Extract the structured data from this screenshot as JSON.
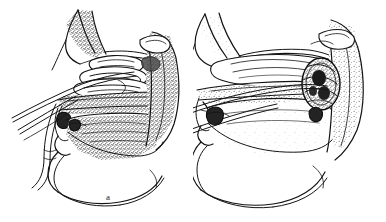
{
  "figure": {
    "kind": "anatomical-line-drawing",
    "background_color": "#ffffff",
    "ink_color": "#141414",
    "panel_count": 2,
    "width_px": 386,
    "height_px": 222
  },
  "panels": [
    {
      "id": "a",
      "caption": "a",
      "side": "left",
      "title": "Sagittal head section, panel a",
      "structures": [
        "nasal bridge",
        "frontal region",
        "superior turbinate",
        "middle turbinate",
        "inferior turbinate",
        "hard palate",
        "soft palate",
        "tongue",
        "oropharynx",
        "posterior pharyngeal wall",
        "upper lip",
        "lower lip",
        "mandible",
        "submental soft tissue"
      ],
      "instruments": [
        "flexible catheter entering nostril",
        "second catheter limb",
        "third catheter limb"
      ],
      "shading": "dense stipple over turbinates, tongue and posterior pharyngeal wall"
    },
    {
      "id": "b",
      "caption": "b",
      "side": "right",
      "title": "Sagittal head section, panel b",
      "structures": [
        "nasal bridge",
        "frontal region",
        "flattened turbinates",
        "hard palate",
        "soft palate",
        "tongue",
        "oropharynx",
        "posterior pharyngeal wall",
        "upper lip",
        "lower lip",
        "mandible",
        "submental soft tissue"
      ],
      "instruments": [
        "flexible catheter entering nostril",
        "second catheter limb"
      ],
      "findings": [
        "dark rounded mass in the nasopharynx against the posterior pharyngeal wall"
      ],
      "shading": "light stipple over tongue, dense stipple confined to the nasopharyngeal mass"
    }
  ],
  "captions": {
    "a": "a",
    "b": "b"
  }
}
